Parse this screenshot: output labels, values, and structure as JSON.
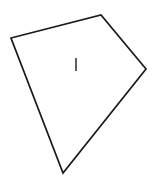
{
  "figure": {
    "background_color": "#ffffff",
    "stroke_color": "#1a1a1a",
    "tick_color": "#2b2b2b",
    "canvas": {
      "width": 153,
      "height": 177
    },
    "shape": {
      "name": "quadrilateral",
      "kind": "kite",
      "sides": 4,
      "fill_color": "#ffffff",
      "stroke_width": 1.7,
      "points": "11,38 101,15 146,69 63,173",
      "vertices": [
        {
          "label": "left",
          "x": 11,
          "y": 38
        },
        {
          "label": "top",
          "x": 101,
          "y": 15
        },
        {
          "label": "right",
          "x": 146,
          "y": 69
        },
        {
          "label": "bottom",
          "x": 63,
          "y": 173
        }
      ]
    },
    "interior_mark": {
      "label": "I",
      "kind": "vertical-tick",
      "x": 76,
      "y1": 58,
      "y2": 71,
      "stroke_width": 1.5
    }
  }
}
